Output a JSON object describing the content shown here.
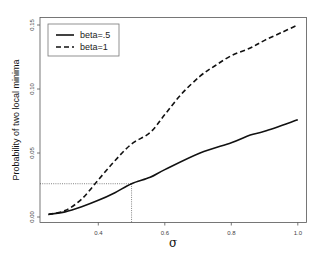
{
  "chart_data": {
    "type": "line",
    "title": "",
    "xlabel": "σ",
    "ylabel": "Probability of two local minima",
    "xlim": [
      0.225,
      1.025
    ],
    "ylim": [
      0.0,
      0.1545
    ],
    "xticks": [
      0.4,
      0.6,
      0.8,
      1.0
    ],
    "xtick_labels": [
      "0.4",
      "0.6",
      "0.8",
      "1.0"
    ],
    "yticks": [
      0.0,
      0.05,
      0.1,
      0.15
    ],
    "ytick_labels": [
      "0.00",
      "0.05",
      "0.10",
      "0.15"
    ],
    "grid": false,
    "legend_position": "top-left",
    "series": [
      {
        "name": "beta=.5",
        "style": "solid",
        "x": [
          0.25,
          0.3,
          0.35,
          0.4,
          0.45,
          0.5,
          0.556,
          0.6,
          0.706,
          0.8,
          0.857,
          0.9,
          1.0
        ],
        "y": [
          0.002,
          0.004,
          0.008,
          0.013,
          0.019,
          0.026,
          0.031,
          0.037,
          0.05,
          0.058,
          0.064,
          0.067,
          0.076
        ]
      },
      {
        "name": "beta=1",
        "style": "dashed",
        "x": [
          0.25,
          0.3,
          0.35,
          0.4,
          0.45,
          0.5,
          0.556,
          0.6,
          0.65,
          0.706,
          0.75,
          0.8,
          0.857,
          0.9,
          0.95,
          1.0
        ],
        "y": [
          0.002,
          0.005,
          0.014,
          0.029,
          0.044,
          0.057,
          0.066,
          0.08,
          0.096,
          0.11,
          0.118,
          0.126,
          0.132,
          0.138,
          0.144,
          0.15
        ]
      }
    ],
    "annotations": [
      {
        "type": "reference-lines",
        "style": "dotted",
        "x": 0.5,
        "y": 0.026
      }
    ]
  }
}
